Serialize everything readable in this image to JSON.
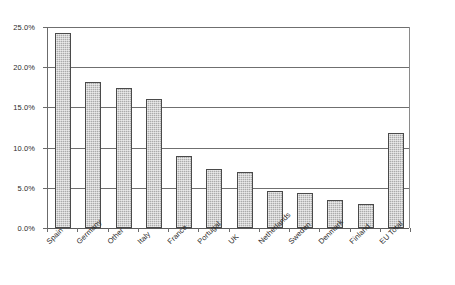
{
  "chart_data": {
    "type": "bar",
    "title": "",
    "subtitle": "",
    "xlabel": "",
    "ylabel": "",
    "categories": [
      "Spain",
      "Germany",
      "Other",
      "Italy",
      "France",
      "Portugal",
      "UK",
      "Netherlands",
      "Sweden",
      "Denmark",
      "Finland",
      "EU Total"
    ],
    "values": [
      24.3,
      18.1,
      17.4,
      16.0,
      9.0,
      7.4,
      7.0,
      4.6,
      4.3,
      3.5,
      3.0,
      11.8
    ],
    "value_labels": [
      "24.3%",
      "18.1%",
      "17.4%",
      "16.0%",
      "9.0%",
      "7.4%",
      "7.0%",
      "4.6%",
      "4.3%",
      "3.5%",
      "3.0%",
      "11.8%"
    ],
    "ylim": [
      0,
      25
    ],
    "ytick_values": [
      0,
      5,
      10,
      15,
      20,
      25
    ],
    "ytick_labels": [
      "0.0%",
      "5.0%",
      "10.0%",
      "15.0%",
      "20.0%",
      "25.0%"
    ],
    "grid": true,
    "grid_axis": "y",
    "legend": false,
    "legend_position": "none",
    "series": [
      {
        "name": "Share",
        "values": [
          24.3,
          18.1,
          17.4,
          16.0,
          9.0,
          7.4,
          7.0,
          4.6,
          4.3,
          3.5,
          3.0,
          11.8
        ]
      }
    ],
    "bar_fill_color": "#ababab",
    "bar_border_color": "#4a4a4a",
    "axis_color": "#6b6b6b",
    "gridline_color": "#6f6f6f",
    "background_color": "#ffffff",
    "text_color": "#2a2a2a",
    "xtick_label_rotation": -45
  }
}
